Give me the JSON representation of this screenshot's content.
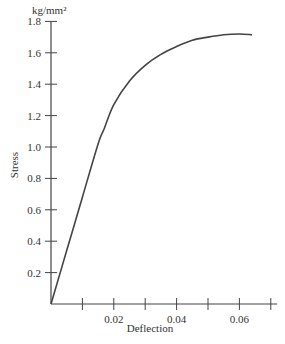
{
  "chart_data": {
    "type": "line",
    "title": "",
    "xlabel": "Deflection",
    "ylabel": "Stress",
    "yunit": "kg/mm²",
    "xlim": [
      0,
      0.072
    ],
    "ylim": [
      0,
      1.8
    ],
    "grid": false,
    "legend": null,
    "x_ticks": [
      0.01,
      0.02,
      0.03,
      0.04,
      0.05,
      0.06,
      0.07
    ],
    "x_tick_labels": [
      "",
      "0.02",
      "",
      "0.04",
      "",
      "0.06",
      ""
    ],
    "y_ticks": [
      0.2,
      0.4,
      0.6,
      0.8,
      1.0,
      1.2,
      1.4,
      1.6,
      1.8
    ],
    "y_tick_labels": [
      "0.2",
      "0.4",
      "0.6",
      "0.8",
      "1.0",
      "1.2",
      "1.4",
      "1.6",
      "1.8"
    ],
    "series": [
      {
        "name": "Stress-Deflection",
        "x": [
          0,
          0.005,
          0.01,
          0.015,
          0.017,
          0.02,
          0.025,
          0.03,
          0.035,
          0.04,
          0.045,
          0.05,
          0.055,
          0.06,
          0.064
        ],
        "y": [
          0,
          0.34,
          0.68,
          1.02,
          1.12,
          1.27,
          1.42,
          1.52,
          1.59,
          1.64,
          1.68,
          1.7,
          1.715,
          1.72,
          1.715
        ]
      }
    ]
  },
  "labels": {
    "yunit": "kg/mm²",
    "ylabel": "Stress",
    "xlabel": "Deflection"
  },
  "style": {
    "line_color": "#444444",
    "axis_color": "#444444"
  }
}
